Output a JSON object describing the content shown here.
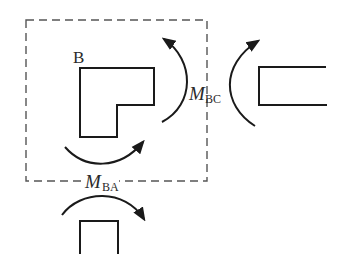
{
  "diagram": {
    "type": "free-body diagram of rigid joint B with end moments",
    "joint_label": "B",
    "moments": [
      {
        "id": "M_BC",
        "symbol": "M",
        "subscript": "BC",
        "description": "end moment between joint B and member BC"
      },
      {
        "id": "M_BA",
        "symbol": "M",
        "subscript": "BA",
        "description": "end moment between joint B and member BA"
      }
    ],
    "members": [
      {
        "id": "BC",
        "position": "right",
        "orientation": "horizontal"
      },
      {
        "id": "BA",
        "position": "bottom",
        "orientation": "vertical"
      }
    ],
    "free_body_boundary": "dashed rectangle enclosing joint B",
    "colors": {
      "stroke": "#1a1a1a",
      "dashed": "#555555",
      "background": "#ffffff"
    }
  }
}
